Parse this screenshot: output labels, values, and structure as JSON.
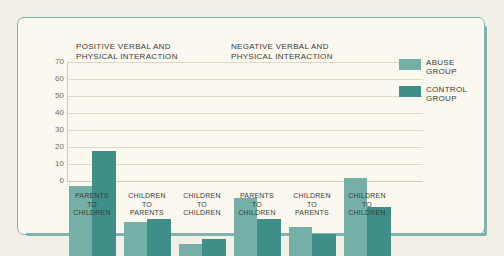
{
  "chart_data": {
    "type": "bar",
    "title": "",
    "xlabel": "",
    "ylabel": "",
    "ylim": [
      0,
      70
    ],
    "yticks": [
      0,
      10,
      20,
      30,
      40,
      50,
      60,
      70
    ],
    "grid": true,
    "legend_position": "right",
    "legend": [
      "ABUSE\nGROUP",
      "CONTROL\nGROUP"
    ],
    "colors": {
      "abuse": "#74b0a8",
      "control": "#3f8f89",
      "background": "#faf8ef",
      "frame": "#7fb3ac",
      "grid": "#ded9c6",
      "text": "#3b3b36"
    },
    "panels": [
      {
        "title": "POSITIVE VERBAL AND\nPHYSICAL INTERACTION",
        "categories": [
          "PARENTS\nTO\nCHILDREN",
          "CHILDREN\nTO\nPARENTS",
          "CHILDREN\nTO\nCHILDREN"
        ],
        "series": [
          {
            "name": "ABUSE GROUP",
            "values": [
              41,
              20,
              7
            ]
          },
          {
            "name": "CONTROL GROUP",
            "values": [
              62,
              22,
              10
            ]
          }
        ]
      },
      {
        "title": "NEGATIVE VERBAL AND\nPHYSICAL INTERACTION",
        "categories": [
          "PARENTS\nTO\nCHILDREN",
          "CHILDREN\nTO\nPARENTS",
          "CHILDREN\nTO\nCHILDREN"
        ],
        "series": [
          {
            "name": "ABUSE GROUP",
            "values": [
              34,
              17,
              46
            ]
          },
          {
            "name": "CONTROL GROUP",
            "values": [
              22,
              13,
              29
            ]
          }
        ]
      }
    ]
  },
  "yaxis": {
    "t0": "0",
    "t1": "10",
    "t2": "20",
    "t3": "30",
    "t4": "40",
    "t5": "50",
    "t6": "60",
    "t7": "70"
  },
  "panel_titles": {
    "positive": "POSITIVE VERBAL AND\nPHYSICAL INTERACTION",
    "negative": "NEGATIVE VERBAL AND\nPHYSICAL INTERACTION"
  },
  "categories": {
    "parents_to_children": "PARENTS\nTO\nCHILDREN",
    "children_to_parents": "CHILDREN\nTO\nPARENTS",
    "children_to_children": "CHILDREN\nTO\nCHILDREN"
  },
  "legend": {
    "abuse": "ABUSE\nGROUP",
    "control": "CONTROL\nGROUP"
  }
}
